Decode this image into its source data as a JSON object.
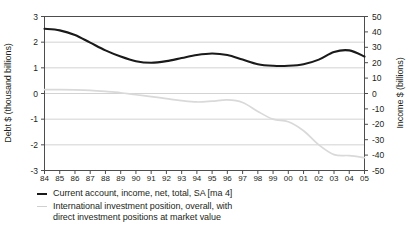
{
  "chart_data": {
    "type": "line",
    "title": "",
    "xlabel": "",
    "ylabel": "Debt $ (thousand billions)",
    "y2label": "Income $ (billions)",
    "grid": true,
    "legend_position": "below",
    "categories": [
      "84",
      "85",
      "86",
      "87",
      "88",
      "89",
      "90",
      "91",
      "92",
      "93",
      "94",
      "95",
      "96",
      "97",
      "98",
      "99",
      "00",
      "01",
      "02",
      "03",
      "04",
      "05"
    ],
    "ylim": [
      -3,
      3
    ],
    "yticks": [
      3,
      2,
      1,
      0,
      -1,
      -2,
      -3
    ],
    "y2lim": [
      -50,
      50
    ],
    "y2ticks": [
      50,
      40,
      30,
      20,
      10,
      0,
      -10,
      -20,
      -30,
      -40,
      -50
    ],
    "series": [
      {
        "name": "Current account, income, net, total, SA [ma 4]",
        "axis": "right",
        "color": "#1a1a1a",
        "units": "billions",
        "values": [
          42,
          41,
          38,
          33,
          28,
          24,
          21,
          20,
          21,
          23,
          25,
          26,
          25,
          22,
          19,
          18,
          18,
          19,
          22,
          27,
          28,
          24
        ]
      },
      {
        "name": "International investment position, overall, with direct investment positions at market value",
        "axis": "left",
        "color": "#d9d9d9",
        "units": "thousand billions",
        "values": [
          0.15,
          0.15,
          0.14,
          0.12,
          0.08,
          0.03,
          -0.05,
          -0.12,
          -0.2,
          -0.28,
          -0.33,
          -0.3,
          -0.25,
          -0.35,
          -0.7,
          -1.0,
          -1.1,
          -1.45,
          -2.0,
          -2.38,
          -2.42,
          -2.5
        ]
      }
    ]
  },
  "axes": {
    "left": {
      "title": "Debt $ (thousand billions)",
      "tick_labels": [
        "3",
        "2",
        "1",
        "0",
        "-1",
        "-2",
        "-3"
      ]
    },
    "right": {
      "title": "Income $ (billions)",
      "tick_labels": [
        "50",
        "40",
        "30",
        "20",
        "10",
        "0",
        "-10",
        "-20",
        "-30",
        "-40",
        "-50"
      ]
    },
    "bottom": {
      "tick_labels": [
        "84",
        "85",
        "86",
        "87",
        "88",
        "89",
        "90",
        "91",
        "92",
        "93",
        "94",
        "95",
        "96",
        "97",
        "98",
        "99",
        "00",
        "01",
        "02",
        "03",
        "04",
        "05"
      ]
    }
  },
  "legend": {
    "items": [
      {
        "marker": "dark",
        "line1": "Current account, income, net, total, SA [ma 4]",
        "line2": ""
      },
      {
        "marker": "light",
        "line1": "International investment position, overall, with",
        "line2": "direct investment positions at market value"
      }
    ]
  },
  "colors": {
    "series_dark": "#1a1a1a",
    "series_light": "#d9d9d9",
    "grid": "#c8c8c8",
    "axis": "#4d4d4d",
    "text": "#231f20"
  }
}
